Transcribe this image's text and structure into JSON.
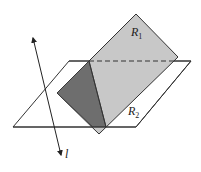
{
  "figure": {
    "labels": {
      "region_top": {
        "main": "R",
        "sub": "1"
      },
      "region_bottom": {
        "main": "R",
        "sub": "2"
      },
      "axis": "l"
    },
    "colors": {
      "region_light": "#c8c8c8",
      "region_dark": "#6e6e6e",
      "stroke": "#333333",
      "background": "#ffffff"
    }
  }
}
